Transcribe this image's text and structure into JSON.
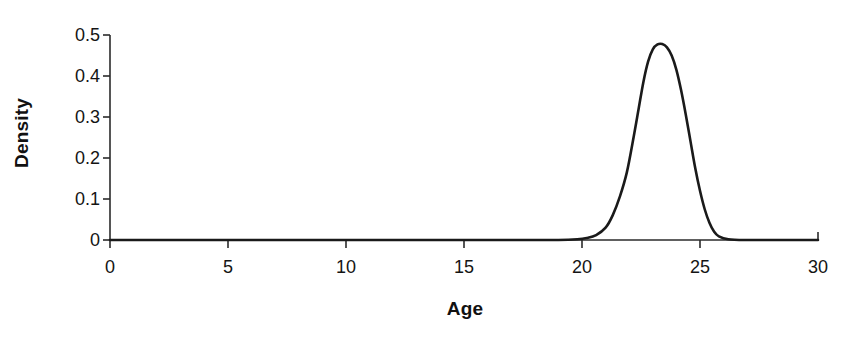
{
  "chart_data": {
    "type": "line",
    "title": "",
    "xlabel": "Age",
    "ylabel": "Density",
    "xlim": [
      0,
      30
    ],
    "ylim": [
      0,
      0.5
    ],
    "grid": false,
    "legend": "none",
    "x_ticks": [
      "0",
      "5",
      "10",
      "15",
      "20",
      "25",
      "30"
    ],
    "x_tick_values": [
      0,
      5,
      10,
      15,
      20,
      25,
      30
    ],
    "y_ticks": [
      "0",
      "0.1",
      "0.2",
      "0.3",
      "0.4",
      "0.5"
    ],
    "y_tick_values": [
      0,
      0.1,
      0.2,
      0.3,
      0.4,
      0.5
    ],
    "series": [
      {
        "name": "Age density",
        "color": "#1a1a1a",
        "line_width": 2.6,
        "peak_x": 23.4,
        "peak_y": 0.478,
        "x": [
          0,
          2,
          4,
          6,
          8,
          10,
          12,
          14,
          16,
          18,
          19,
          19.8,
          20.2,
          20.6,
          21.0,
          21.3,
          21.6,
          21.9,
          22.2,
          22.4,
          22.6,
          22.8,
          23.0,
          23.2,
          23.4,
          23.6,
          23.8,
          24.0,
          24.2,
          24.4,
          24.6,
          24.8,
          25.0,
          25.2,
          25.4,
          25.6,
          25.8,
          26.2,
          27,
          28,
          30
        ],
        "y": [
          0,
          0,
          0,
          0,
          0,
          0,
          0,
          0,
          0,
          0,
          0,
          0.002,
          0.005,
          0.012,
          0.03,
          0.06,
          0.105,
          0.165,
          0.255,
          0.32,
          0.385,
          0.435,
          0.465,
          0.477,
          0.478,
          0.47,
          0.45,
          0.415,
          0.365,
          0.305,
          0.24,
          0.175,
          0.12,
          0.075,
          0.042,
          0.02,
          0.009,
          0.002,
          0,
          0,
          0
        ]
      }
    ]
  },
  "axes": {
    "y_axis_label": "Density",
    "x_axis_label": "Age"
  }
}
